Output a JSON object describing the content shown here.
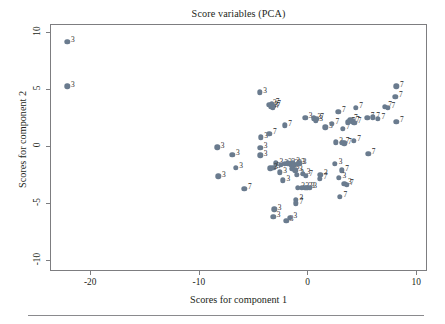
{
  "figure": {
    "title": "Score variables (PCA)",
    "xlabel": "Scores for component 1",
    "ylabel": "Scores for component 2"
  },
  "axes": {
    "x_ticks": [
      "-20",
      "-10",
      "0",
      "10"
    ],
    "y_ticks": [
      "10",
      "5",
      "0",
      "-5",
      "-10"
    ]
  },
  "colors": {
    "marker": "#6a7b8e",
    "frame": "#7d7d80",
    "text": "#231f20"
  },
  "chart_data": {
    "type": "scatter",
    "title": "Score variables (PCA)",
    "xlabel": "Scores for component 1",
    "ylabel": "Scores for component 2",
    "xlim": [
      -23.7,
      11.0
    ],
    "ylim": [
      -11.0,
      10.7
    ],
    "xticks": [
      -20,
      -10,
      0,
      10
    ],
    "yticks": [
      -10,
      -5,
      0,
      5,
      10
    ],
    "grid": false,
    "legend": "none",
    "marker_color": "#6a7b8e",
    "point_label_field": "group",
    "groups": [
      "3",
      "7"
    ],
    "points": [
      {
        "x": -22.2,
        "y": 9.2,
        "group": "3"
      },
      {
        "x": -22.2,
        "y": 5.3,
        "group": "3"
      },
      {
        "x": -4.5,
        "y": 4.8,
        "group": "3"
      },
      {
        "x": -3.6,
        "y": 3.7,
        "group": "3"
      },
      {
        "x": -3.35,
        "y": 3.8,
        "group": "7"
      },
      {
        "x": -3.2,
        "y": 3.6,
        "group": "7"
      },
      {
        "x": -3.45,
        "y": 3.5,
        "group": "3"
      },
      {
        "x": -3.3,
        "y": 3.45,
        "group": "7"
      },
      {
        "x": -4.4,
        "y": 0.85,
        "group": "3"
      },
      {
        "x": -3.6,
        "y": 1.15,
        "group": "7"
      },
      {
        "x": -2.2,
        "y": 1.9,
        "group": "7"
      },
      {
        "x": -0.3,
        "y": 2.55,
        "group": "3"
      },
      {
        "x": 0.5,
        "y": 2.5,
        "group": "3"
      },
      {
        "x": 0.75,
        "y": 2.45,
        "group": "7"
      },
      {
        "x": 0.65,
        "y": 2.3,
        "group": "3"
      },
      {
        "x": 1.55,
        "y": 1.7,
        "group": "3"
      },
      {
        "x": 2.15,
        "y": 2.0,
        "group": "7"
      },
      {
        "x": 2.75,
        "y": 3.1,
        "group": "7"
      },
      {
        "x": 3.15,
        "y": 1.6,
        "group": "7"
      },
      {
        "x": 3.6,
        "y": 2.15,
        "group": "7"
      },
      {
        "x": 3.85,
        "y": 2.35,
        "group": "7"
      },
      {
        "x": 4.05,
        "y": 2.25,
        "group": "7"
      },
      {
        "x": 4.2,
        "y": 2.1,
        "group": "7"
      },
      {
        "x": 4.35,
        "y": 3.4,
        "group": "7"
      },
      {
        "x": 5.4,
        "y": 2.55,
        "group": "7"
      },
      {
        "x": 5.9,
        "y": 2.6,
        "group": "7"
      },
      {
        "x": 6.4,
        "y": 2.45,
        "group": "7"
      },
      {
        "x": 7.0,
        "y": 3.5,
        "group": "7"
      },
      {
        "x": 7.3,
        "y": 3.4,
        "group": "7"
      },
      {
        "x": 8.1,
        "y": 5.3,
        "group": "7"
      },
      {
        "x": 8.0,
        "y": 4.4,
        "group": "7"
      },
      {
        "x": 8.1,
        "y": 2.2,
        "group": "7"
      },
      {
        "x": 2.5,
        "y": 0.4,
        "group": "3"
      },
      {
        "x": 3.1,
        "y": 0.35,
        "group": "7"
      },
      {
        "x": 3.3,
        "y": 0.3,
        "group": "7"
      },
      {
        "x": 4.15,
        "y": 0.55,
        "group": "7"
      },
      {
        "x": 5.5,
        "y": -0.6,
        "group": "7"
      },
      {
        "x": -8.4,
        "y": -0.05,
        "group": "3"
      },
      {
        "x": -7.0,
        "y": -0.7,
        "group": "3"
      },
      {
        "x": -4.45,
        "y": -0.1,
        "group": "3"
      },
      {
        "x": -4.45,
        "y": -0.75,
        "group": "3"
      },
      {
        "x": -6.7,
        "y": -1.85,
        "group": "3"
      },
      {
        "x": -8.3,
        "y": -2.6,
        "group": "3"
      },
      {
        "x": -5.9,
        "y": -3.7,
        "group": "7"
      },
      {
        "x": -3.0,
        "y": -1.45,
        "group": "3"
      },
      {
        "x": -3.25,
        "y": -1.85,
        "group": "3"
      },
      {
        "x": -3.5,
        "y": -1.9,
        "group": "3"
      },
      {
        "x": -2.55,
        "y": -1.6,
        "group": "3"
      },
      {
        "x": -2.2,
        "y": -1.5,
        "group": "3"
      },
      {
        "x": -1.9,
        "y": -1.45,
        "group": "3"
      },
      {
        "x": -1.6,
        "y": -1.55,
        "group": "3"
      },
      {
        "x": -1.45,
        "y": -1.4,
        "group": "3"
      },
      {
        "x": -1.3,
        "y": -1.6,
        "group": "3"
      },
      {
        "x": -1.5,
        "y": -1.95,
        "group": "3"
      },
      {
        "x": -1.2,
        "y": -2.05,
        "group": "3"
      },
      {
        "x": -1.0,
        "y": -1.5,
        "group": "3"
      },
      {
        "x": -0.85,
        "y": -1.45,
        "group": "3"
      },
      {
        "x": -2.65,
        "y": -2.25,
        "group": "3"
      },
      {
        "x": -1.1,
        "y": -2.45,
        "group": "3"
      },
      {
        "x": -0.5,
        "y": -2.35,
        "group": "3"
      },
      {
        "x": -0.25,
        "y": -2.55,
        "group": "7"
      },
      {
        "x": -2.35,
        "y": -2.95,
        "group": "3"
      },
      {
        "x": -1.0,
        "y": -3.6,
        "group": "3"
      },
      {
        "x": -0.6,
        "y": -3.6,
        "group": "3"
      },
      {
        "x": -0.3,
        "y": -3.6,
        "group": "3"
      },
      {
        "x": -0.1,
        "y": -3.6,
        "group": "3"
      },
      {
        "x": 0.1,
        "y": -3.6,
        "group": "3"
      },
      {
        "x": 2.45,
        "y": -1.5,
        "group": "3"
      },
      {
        "x": 3.05,
        "y": -2.05,
        "group": "7"
      },
      {
        "x": 2.8,
        "y": -2.7,
        "group": "3"
      },
      {
        "x": 3.3,
        "y": -3.25,
        "group": "3"
      },
      {
        "x": 3.5,
        "y": -3.35,
        "group": "7"
      },
      {
        "x": 2.9,
        "y": -4.4,
        "group": "7"
      },
      {
        "x": 1.1,
        "y": -2.45,
        "group": "3"
      },
      {
        "x": 1.05,
        "y": -2.8,
        "group": "7"
      },
      {
        "x": -1.15,
        "y": -4.65,
        "group": "3"
      },
      {
        "x": -1.15,
        "y": -4.95,
        "group": "7"
      },
      {
        "x": -3.15,
        "y": -5.5,
        "group": "3"
      },
      {
        "x": -3.25,
        "y": -6.15,
        "group": "3"
      },
      {
        "x": -2.05,
        "y": -6.5,
        "group": "3"
      },
      {
        "x": -1.7,
        "y": -6.25,
        "group": "3"
      }
    ]
  }
}
